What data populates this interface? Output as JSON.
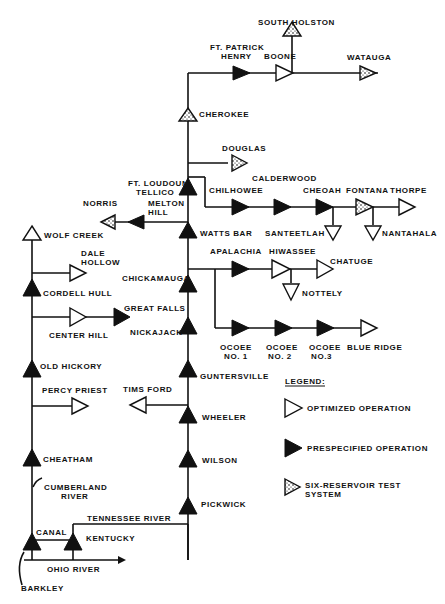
{
  "diagram": {
    "type": "reservoir-system-schematic",
    "reservoirs": {
      "south_holston": "SOUTH HOLSTON",
      "ft_patrick_henry": [
        "FT. PATRICK",
        "HENRY"
      ],
      "boone": "BOONE",
      "watauga": "WATAUGA",
      "cherokee": "CHEROKEE",
      "douglas": "DOUGLAS",
      "ft_loudoun_tellico": [
        "FT. LOUDOUN",
        "TELLICO"
      ],
      "calderwood": "CALDERWOOD",
      "chilhowee": "CHILHOWEE",
      "cheoah": "CHEOAH",
      "fontana": "FONTANA",
      "thorpe": "THORPE",
      "santeetlah": "SANTEETLAH",
      "nantahala": "NANTAHALA",
      "norris": "NORRIS",
      "melton_hill": [
        "MELTON",
        "HILL"
      ],
      "watts_bar": "WATTS BAR",
      "wolf_creek": "WOLF CREEK",
      "dale_hollow": [
        "DALE",
        "HOLLOW"
      ],
      "cordell_hull": "CORDELL HULL",
      "apalachia": "APALACHIA",
      "hiwassee": "HIWASSEE",
      "chatuge": "CHATUGE",
      "nottely": "NOTTELY",
      "chickamauga": "CHICKAMAUGA",
      "great_falls": "GREAT FALLS",
      "center_hill": "CENTER HILL",
      "nickajack": "NICKAJACK",
      "ocoee1": [
        "OCOEE",
        "NO. 1"
      ],
      "ocoee2": [
        "OCOEE",
        "NO. 2"
      ],
      "ocoee3": [
        "OCOEE",
        "NO.3"
      ],
      "blue_ridge": "BLUE RIDGE",
      "old_hickory": "OLD HICKORY",
      "guntersville": "GUNTERSVILLE",
      "percy_priest": "PERCY PRIEST",
      "tims_ford": "TIMS FORD",
      "wheeler": "WHEELER",
      "wilson": "WILSON",
      "cheatham": "CHEATHAM",
      "pickwick": "PICKWICK",
      "kentucky": "KENTUCKY",
      "barkley": "BARKLEY"
    },
    "rivers": {
      "cumberland": [
        "CUMBERLAND",
        "RIVER"
      ],
      "tennessee": "TENNESSEE RIVER",
      "ohio": "OHIO RIVER",
      "canal": "CANAL"
    },
    "legend": {
      "title": "LEGEND:",
      "items": [
        {
          "symbol": "open-triangle",
          "label": "OPTIMIZED OPERATION"
        },
        {
          "symbol": "filled-triangle",
          "label": "PRESPECIFIED OPERATION"
        },
        {
          "symbol": "dotted-triangle",
          "label": [
            "SIX-RESERVOIR TEST",
            "SYSTEM"
          ]
        }
      ]
    }
  }
}
